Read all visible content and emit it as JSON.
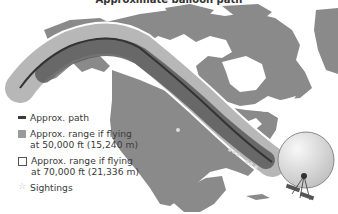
{
  "title": "Approximate balloon path",
  "legend": {
    "items": [
      {
        "id": "path",
        "label_line1": "Approx. path",
        "label_line2": "",
        "swatch": "line",
        "color": "#3a3a3a"
      },
      {
        "id": "range50k",
        "label_line1": "Approx. range if flying",
        "label_line2": "at 50,000 ft (15,240 m)",
        "swatch": "fill",
        "color": "#9a9a9a"
      },
      {
        "id": "range70k",
        "label_line1": "Approx. range if flying",
        "label_line2": "at 70,000 ft (21,336 m)",
        "swatch": "outline",
        "color": "#ffffff"
      },
      {
        "id": "sightings",
        "label_line1": "Sightings",
        "label_line2": "",
        "swatch": "star",
        "color": "#cccccc"
      }
    ]
  },
  "map": {
    "region": "North America",
    "land_color": "#8a8a8a",
    "water_color": "#ffffff",
    "band_inner_color": "#5a5a5a",
    "band_outer_color": "#aaaaaa",
    "path_color": "#333333",
    "sighting_icon": "star-icon",
    "balloon_icon": "balloon-icon"
  }
}
